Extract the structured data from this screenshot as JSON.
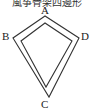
{
  "caption": "風筝骨架四邊形",
  "diagram": {
    "type": "kite-frame",
    "vertices": [
      {
        "id": "A",
        "label": "A"
      },
      {
        "id": "B",
        "label": "B"
      },
      {
        "id": "C",
        "label": "C"
      },
      {
        "id": "D",
        "label": "D"
      }
    ],
    "stroke_color": "#333333"
  }
}
